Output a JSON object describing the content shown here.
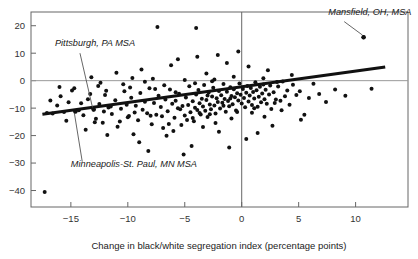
{
  "chart_data": {
    "type": "scatter",
    "title": "",
    "xlabel": "Change in black/white segregation index (percentage points)",
    "ylabel": "",
    "xlim": [
      -18.5,
      14.6
    ],
    "ylim": [
      -46,
      25
    ],
    "xticks": [
      -15,
      -10,
      -5,
      0,
      5,
      10
    ],
    "xtick_labels": [
      "−15",
      "−10",
      "−5",
      "0",
      "5",
      "10"
    ],
    "yticks": [
      20,
      10,
      0,
      -10,
      -20,
      -30,
      -40
    ],
    "ytick_labels": [
      "20",
      "10",
      "0",
      "−10",
      "−20",
      "−30",
      "−40"
    ],
    "grid": false,
    "legend": "none",
    "reference_lines": [
      {
        "name": "y-zero-line",
        "orientation": "horizontal",
        "value": 0,
        "color": "#999999"
      },
      {
        "name": "x-zero-line",
        "orientation": "vertical",
        "value": 0,
        "color": "#666666"
      }
    ],
    "trend_line": {
      "name": "regression-line",
      "color": "#111111",
      "width": 3.0,
      "x_start": -17.5,
      "y_start": -12.2,
      "x_end": 12.6,
      "y_end": 5.0,
      "slope": 0.571,
      "intercept": -2.2
    },
    "annotations": [
      {
        "name": "mansfield-annotation",
        "label": "Mansfield, OH, MSA",
        "text_x": 7.6,
        "text_y": 24.0,
        "point_x": 10.7,
        "point_y": 15.8,
        "leader": [
          [
            9.0,
            21.5
          ],
          [
            10.6,
            16.6
          ]
        ]
      },
      {
        "name": "pittsburgh-annotation",
        "label": "Pittsburgh, PA MSA",
        "text_x": -16.4,
        "text_y": 12.6,
        "point_x": -13.0,
        "point_y": -10.5,
        "leader": [
          [
            -14.2,
            10.0
          ],
          [
            -13.1,
            -9.8
          ]
        ]
      },
      {
        "name": "minneapolis-annotation",
        "label": "Minneapolis-St. Paul, MN MSA",
        "text_x": -15.0,
        "text_y": -31.6,
        "point_x": -14.6,
        "point_y": -11.2,
        "leader": [
          [
            -14.0,
            -29.5
          ],
          [
            -14.7,
            -11.6
          ]
        ]
      }
    ],
    "marker": {
      "shape": "circle",
      "color": "#111111",
      "size": 2.0
    },
    "points": [
      [
        -17.3,
        -40.5
      ],
      [
        -17.1,
        -11.8
      ],
      [
        -16.6,
        -12.0
      ],
      [
        -16.0,
        -2.3
      ],
      [
        -15.6,
        -11.4
      ],
      [
        -15.2,
        -7.9
      ],
      [
        -14.9,
        -3.6
      ],
      [
        -14.6,
        -11.2
      ],
      [
        -14.3,
        -10.8
      ],
      [
        -13.9,
        -12.6
      ],
      [
        -13.5,
        -6.8
      ],
      [
        -13.0,
        -10.5
      ],
      [
        -12.8,
        -13.9
      ],
      [
        -12.5,
        -8.5
      ],
      [
        -12.2,
        -15.3
      ],
      [
        -12.0,
        -5.2
      ],
      [
        -11.7,
        -9.8
      ],
      [
        -11.4,
        -12.1
      ],
      [
        -11.1,
        -7.1
      ],
      [
        -10.9,
        -16.8
      ],
      [
        -10.6,
        -10.2
      ],
      [
        -10.3,
        -3.9
      ],
      [
        -10.1,
        -8.8
      ],
      [
        -9.9,
        -12.9
      ],
      [
        -9.7,
        -6.2
      ],
      [
        -9.5,
        -19.5
      ],
      [
        -9.3,
        -9.1
      ],
      [
        -9.1,
        -14.4
      ],
      [
        -8.9,
        -4.5
      ],
      [
        -8.7,
        -10.6
      ],
      [
        -8.5,
        -7.7
      ],
      [
        -8.3,
        -11.9
      ],
      [
        -8.1,
        -2.8
      ],
      [
        -7.9,
        -15.9
      ],
      [
        -7.7,
        -8.1
      ],
      [
        -7.5,
        -12.4
      ],
      [
        -7.3,
        -5.5
      ],
      [
        -7.1,
        -9.6
      ],
      [
        -6.9,
        -17.2
      ],
      [
        -6.7,
        -6.9
      ],
      [
        -6.5,
        -11.1
      ],
      [
        -6.3,
        -3.2
      ],
      [
        -6.1,
        -8.4
      ],
      [
        -5.9,
        -13.5
      ],
      [
        -5.8,
        -7.3
      ],
      [
        -5.6,
        -10.0
      ],
      [
        -5.5,
        -4.8
      ],
      [
        -5.3,
        -16.1
      ],
      [
        -5.2,
        -9.2
      ],
      [
        -5.0,
        -12.7
      ],
      [
        -4.9,
        -6.1
      ],
      [
        -4.7,
        -8.9
      ],
      [
        -4.6,
        -2.0
      ],
      [
        -4.5,
        -11.5
      ],
      [
        -4.3,
        -7.5
      ],
      [
        -4.2,
        -14.8
      ],
      [
        -4.1,
        -9.9
      ],
      [
        -4.0,
        -5.0
      ],
      [
        -3.9,
        -10.7
      ],
      [
        -3.8,
        -3.4
      ],
      [
        -3.7,
        -8.2
      ],
      [
        -3.6,
        -12.3
      ],
      [
        -3.5,
        -6.6
      ],
      [
        -3.4,
        -9.4
      ],
      [
        -3.3,
        -1.6
      ],
      [
        -3.2,
        -11.0
      ],
      [
        -3.1,
        -7.0
      ],
      [
        -3.0,
        -13.2
      ],
      [
        -2.9,
        -4.3
      ],
      [
        -2.8,
        -8.7
      ],
      [
        -2.7,
        -10.4
      ],
      [
        -2.6,
        -5.8
      ],
      [
        -2.5,
        -2.6
      ],
      [
        -2.4,
        -9.0
      ],
      [
        -2.3,
        -12.0
      ],
      [
        -2.2,
        -6.4
      ],
      [
        -2.1,
        -7.8
      ],
      [
        -2.0,
        -3.8
      ],
      [
        -1.9,
        -10.1
      ],
      [
        -1.8,
        -5.3
      ],
      [
        -1.7,
        -8.0
      ],
      [
        -1.6,
        -1.2
      ],
      [
        -1.5,
        -6.7
      ],
      [
        -1.4,
        -11.3
      ],
      [
        -1.3,
        -4.0
      ],
      [
        -1.2,
        -7.4
      ],
      [
        -1.1,
        -9.3
      ],
      [
        -1.0,
        -2.4
      ],
      [
        -0.9,
        -5.6
      ],
      [
        -0.8,
        -8.6
      ],
      [
        -0.7,
        -3.1
      ],
      [
        -0.6,
        -6.0
      ],
      [
        -0.5,
        -10.9
      ],
      [
        -0.4,
        -4.6
      ],
      [
        -0.3,
        -7.2
      ],
      [
        -0.2,
        -1.0
      ],
      [
        -0.1,
        -5.1
      ],
      [
        0.0,
        -8.3
      ],
      [
        0.1,
        -3.0
      ],
      [
        0.2,
        -6.3
      ],
      [
        0.3,
        -9.7
      ],
      [
        0.4,
        -4.4
      ],
      [
        0.5,
        -1.9
      ],
      [
        0.6,
        -7.6
      ],
      [
        0.7,
        -5.4
      ],
      [
        0.8,
        -2.7
      ],
      [
        0.9,
        -8.9
      ],
      [
        1.0,
        -4.1
      ],
      [
        1.1,
        -6.5
      ],
      [
        1.2,
        -0.6
      ],
      [
        1.3,
        -3.5
      ],
      [
        1.4,
        -9.5
      ],
      [
        1.5,
        -5.9
      ],
      [
        1.6,
        -2.2
      ],
      [
        1.7,
        -7.9
      ],
      [
        1.8,
        -4.7
      ],
      [
        1.9,
        -1.4
      ],
      [
        2.0,
        -6.8
      ],
      [
        2.1,
        -3.3
      ],
      [
        2.2,
        -8.4
      ],
      [
        2.4,
        -5.0
      ],
      [
        2.5,
        -1.8
      ],
      [
        2.6,
        -10.3
      ],
      [
        2.8,
        -4.2
      ],
      [
        3.0,
        -6.9
      ],
      [
        3.2,
        -2.1
      ],
      [
        3.4,
        -7.3
      ],
      [
        3.6,
        -0.3
      ],
      [
        3.8,
        -5.7
      ],
      [
        4.0,
        -3.6
      ],
      [
        4.2,
        -8.8
      ],
      [
        4.5,
        -1.5
      ],
      [
        4.8,
        -5.2
      ],
      [
        5.1,
        -3.9
      ],
      [
        5.5,
        -12.4
      ],
      [
        5.9,
        -6.3
      ],
      [
        6.3,
        -1.1
      ],
      [
        6.8,
        -4.9
      ],
      [
        7.4,
        -7.8
      ],
      [
        8.2,
        -3.2
      ],
      [
        9.1,
        -5.5
      ],
      [
        10.7,
        15.8
      ],
      [
        11.4,
        -2.9
      ],
      [
        -7.4,
        19.5
      ],
      [
        -4.0,
        19.2
      ],
      [
        -0.3,
        10.6
      ],
      [
        -3.9,
        8.7
      ],
      [
        -5.6,
        7.8
      ],
      [
        -2.1,
        9.3
      ],
      [
        0.6,
        5.2
      ],
      [
        -8.8,
        4.1
      ],
      [
        -11.0,
        2.9
      ],
      [
        -13.2,
        1.2
      ],
      [
        -6.2,
        5.6
      ],
      [
        -1.3,
        6.4
      ],
      [
        2.3,
        3.8
      ],
      [
        4.4,
        2.1
      ],
      [
        -9.6,
        1.0
      ],
      [
        -12.4,
        -0.8
      ],
      [
        -3.1,
        2.6
      ],
      [
        -0.7,
        1.4
      ],
      [
        1.9,
        0.9
      ],
      [
        -5.0,
        0.2
      ],
      [
        -7.8,
        0.7
      ],
      [
        -10.4,
        -1.3
      ],
      [
        -2.6,
        -0.2
      ],
      [
        3.1,
        -0.5
      ],
      [
        -16.2,
        -9.0
      ],
      [
        -15.4,
        -14.6
      ],
      [
        -13.7,
        -17.9
      ],
      [
        -11.8,
        -19.8
      ],
      [
        -9.0,
        -22.4
      ],
      [
        -6.6,
        -20.1
      ],
      [
        -4.4,
        -23.8
      ],
      [
        -2.0,
        -18.6
      ],
      [
        0.4,
        -21.2
      ],
      [
        2.7,
        -16.4
      ],
      [
        5.2,
        -14.2
      ],
      [
        -8.2,
        -25.6
      ],
      [
        -5.1,
        -26.9
      ],
      [
        -1.1,
        -24.3
      ],
      [
        1.4,
        -19.1
      ],
      [
        -3.4,
        -16.9
      ],
      [
        -6.0,
        -18.3
      ],
      [
        -12.9,
        -15.1
      ],
      [
        -10.0,
        -13.3
      ],
      [
        -14.1,
        -8.2
      ],
      [
        -0.9,
        -13.8
      ],
      [
        0.9,
        -11.7
      ],
      [
        2.0,
        -13.1
      ],
      [
        3.5,
        -10.8
      ],
      [
        -4.8,
        -14.3
      ],
      [
        -2.3,
        -15.4
      ],
      [
        -7.0,
        -13.0
      ],
      [
        -9.4,
        -11.6
      ],
      [
        -11.5,
        -9.4
      ],
      [
        -13.3,
        -4.9
      ],
      [
        -15.9,
        -5.7
      ],
      [
        -16.8,
        -7.2
      ],
      [
        -1.6,
        -9.1
      ],
      [
        -3.7,
        -11.8
      ],
      [
        -5.4,
        -10.4
      ],
      [
        -8.0,
        -12.8
      ],
      [
        -10.7,
        -14.9
      ],
      [
        -12.1,
        -11.2
      ],
      [
        -6.4,
        -15.8
      ],
      [
        -4.3,
        -13.6
      ],
      [
        -2.8,
        -12.2
      ],
      [
        -0.4,
        -11.4
      ],
      [
        1.1,
        -10.0
      ],
      [
        2.9,
        -8.1
      ],
      [
        -1.0,
        -6.5
      ],
      [
        -3.0,
        -5.4
      ],
      [
        -5.8,
        -4.2
      ],
      [
        -7.6,
        -3.0
      ],
      [
        -9.8,
        -2.5
      ],
      [
        -11.9,
        -3.7
      ],
      [
        -14.7,
        -2.8
      ],
      [
        -6.8,
        -1.7
      ],
      [
        -4.1,
        -0.9
      ],
      [
        -8.5,
        -0.4
      ],
      [
        -12.6,
        -1.9
      ],
      [
        -2.4,
        0.4
      ]
    ]
  },
  "figure": {
    "background": "#ffffff",
    "axis_color": "#555555",
    "point_color": "#111111",
    "zero_line_color": "#999999"
  }
}
